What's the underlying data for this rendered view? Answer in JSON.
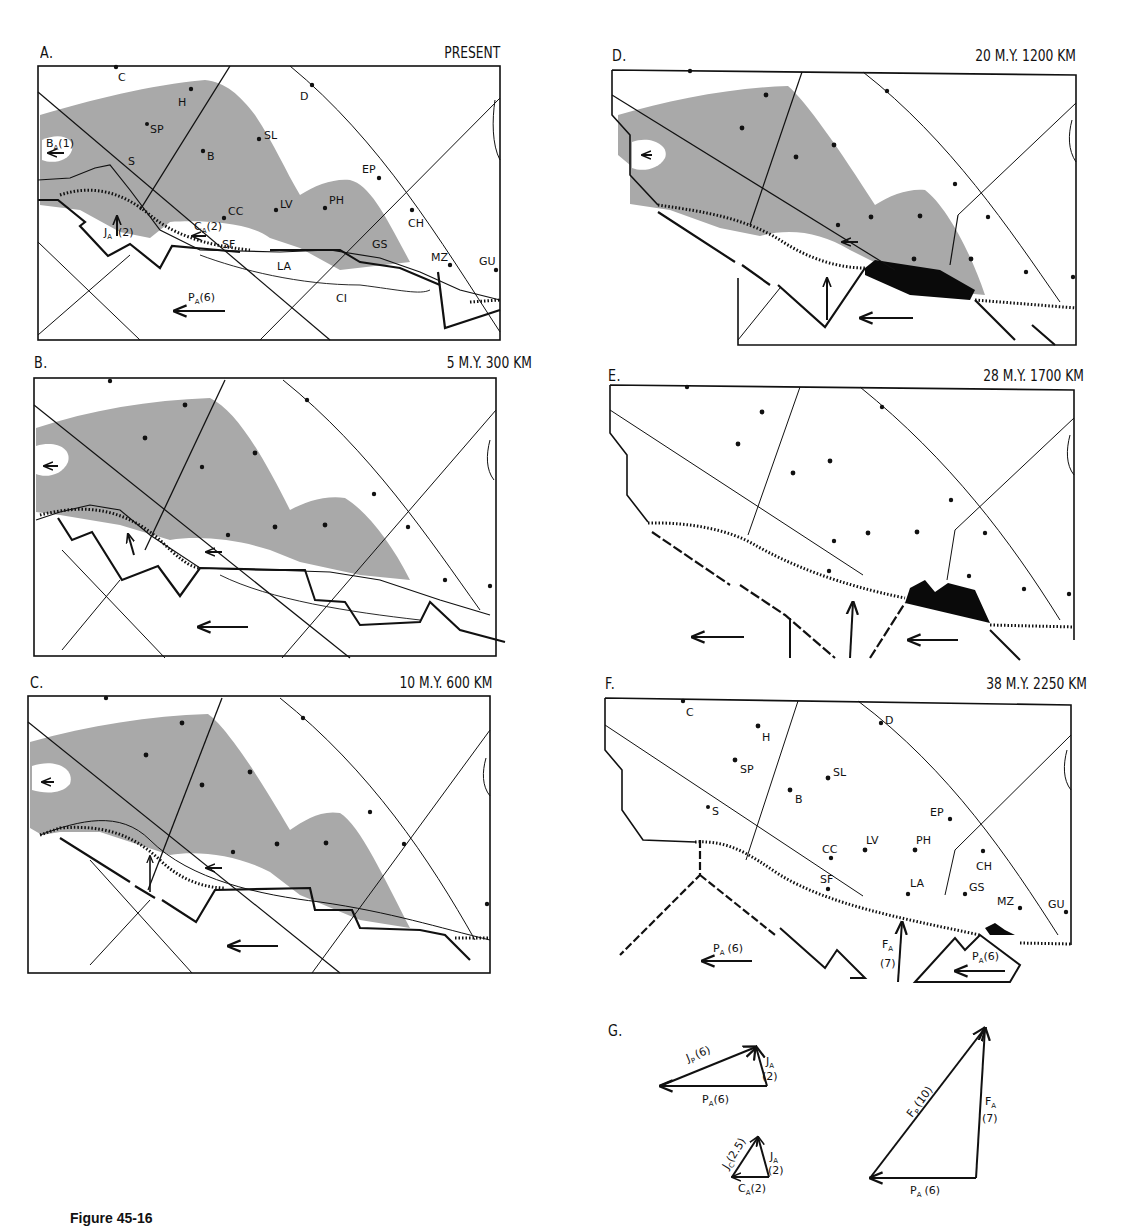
{
  "figure": {
    "caption": "Figure 45-16"
  },
  "colors": {
    "shade": "#a9a9a9",
    "ink": "#111111",
    "block_black": "#0a0a0a",
    "paper": "#ffffff"
  },
  "panels": [
    {
      "id": "A",
      "letter": "A.",
      "caption": "PRESENT",
      "labels": [
        "C",
        "H",
        "SP",
        "D",
        "SL",
        "B",
        "S",
        "EP",
        "CC",
        "LV",
        "PH",
        "CH",
        "SF",
        "GS",
        "LA",
        "MZ",
        "GU",
        "CI"
      ],
      "vectors": [
        "BA(1)",
        "JA(2)",
        "CA(2)",
        "PA(6)"
      ]
    },
    {
      "id": "B",
      "letter": "B.",
      "caption": "5 M.Y.  300 KM"
    },
    {
      "id": "C",
      "letter": "C.",
      "caption": "10 M.Y.  600 KM"
    },
    {
      "id": "D",
      "letter": "D.",
      "caption": "20 M.Y.  1200 KM"
    },
    {
      "id": "E",
      "letter": "E.",
      "caption": "28 M.Y.  1700 KM"
    },
    {
      "id": "F",
      "letter": "F.",
      "caption": "38 M.Y.  2250 KM",
      "labels": [
        "C",
        "H",
        "D",
        "SP",
        "SL",
        "B",
        "S",
        "EP",
        "CC",
        "LV",
        "PH",
        "CH",
        "SF",
        "LA",
        "GS",
        "MZ",
        "GU"
      ],
      "vectors": [
        "PA(6)",
        "FA(7)",
        "PA(6)"
      ]
    },
    {
      "id": "G",
      "letter": "G.",
      "triangles": [
        {
          "name": "J-P-A",
          "vectors": [
            {
              "label": "JP",
              "value": "(6)"
            },
            {
              "label": "JA",
              "value": "(2)"
            },
            {
              "label": "PA",
              "value": "(6)"
            }
          ]
        },
        {
          "name": "J-C-A",
          "vectors": [
            {
              "label": "JC",
              "value": "(2.5)"
            },
            {
              "label": "JA",
              "value": "(2)"
            },
            {
              "label": "CA",
              "value": "(2)"
            }
          ]
        },
        {
          "name": "F-P-A",
          "vectors": [
            {
              "label": "FP",
              "value": "(10)"
            },
            {
              "label": "FA",
              "value": "(7)"
            },
            {
              "label": "PA",
              "value": "(6)"
            }
          ]
        }
      ]
    }
  ],
  "map_labels": {
    "A": {
      "C": "C",
      "H": "H",
      "SP": "SP",
      "D": "D",
      "SL": "SL",
      "B": "B",
      "S": "S",
      "EP": "EP",
      "CC": "CC",
      "LV": "LV",
      "PH": "PH",
      "CH": "CH",
      "SF": "SF",
      "GS": "GS",
      "LA": "LA",
      "MZ": "MZ",
      "GU": "GU",
      "CI": "CI",
      "BA": "B",
      "BA_sub": "A",
      "BA_val": "(1)",
      "JA": "J",
      "JA_sub": "A",
      "JA_val": "(2)",
      "CA": "C",
      "CA_sub": "A",
      "CA_val": "(2)",
      "PA": "P",
      "PA_sub": "A",
      "PA_val": "(6)"
    },
    "F": {
      "C": "C",
      "H": "H",
      "D": "D",
      "SP": "SP",
      "SL": "SL",
      "B": "B",
      "S": "S",
      "EP": "EP",
      "CC": "CC",
      "LV": "LV",
      "PH": "PH",
      "CH": "CH",
      "SF": "SF",
      "LA": "LA",
      "GS": "GS",
      "MZ": "MZ",
      "GU": "GU",
      "PA": "P",
      "PA_sub": "A",
      "PA_val": "(6)",
      "FA": "F",
      "FA_sub": "A",
      "FA_val": "(7)",
      "PA2": "P",
      "PA2_sub": "A",
      "PA2_val": "(6)"
    }
  },
  "vector_labels": {
    "t1": {
      "JP": "J",
      "JP_sub": "P",
      "JP_val": "(6)",
      "JA": "J",
      "JA_sub": "A",
      "JA_val": "(2)",
      "PA": "P",
      "PA_sub": "A",
      "PA_val": "(6)"
    },
    "t2": {
      "JC": "J",
      "JC_sub": "C",
      "JC_val": "(2.5)",
      "JA": "J",
      "JA_sub": "A",
      "JA_val": "(2)",
      "CA": "C",
      "CA_sub": "A",
      "CA_val": "(2)"
    },
    "t3": {
      "FP": "F",
      "FP_sub": "P",
      "FP_val": "(10)",
      "FA": "F",
      "FA_sub": "A",
      "FA_val": "(7)",
      "PA": "P",
      "PA_sub": "A",
      "PA_val": "(6)"
    }
  }
}
